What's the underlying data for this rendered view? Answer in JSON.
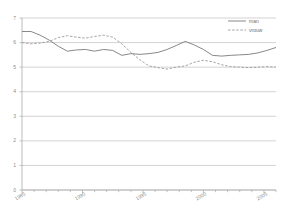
{
  "chart_data": {
    "type": "line",
    "title": "",
    "subtitle": "",
    "xlabel": "",
    "ylabel": "",
    "xlim": [
      1985,
      2006
    ],
    "ylim": [
      0,
      7
    ],
    "yticks": [
      0,
      1,
      2,
      3,
      4,
      5,
      6,
      7
    ],
    "ytick_labels": [
      "0",
      "1",
      "2",
      "3",
      "4",
      "5",
      "6",
      "7"
    ],
    "xticks": [
      1985,
      1990,
      1995,
      2000,
      2005
    ],
    "xtick_labels": [
      "1985",
      "1990",
      "1995",
      "2000",
      "2005"
    ],
    "grid": true,
    "grid_axis": "y",
    "legend_position": "top-right",
    "x": [
      1985,
      1986,
      1987,
      1988,
      1989,
      1990,
      1991,
      1992,
      1993,
      1994,
      1995,
      1996,
      1997,
      1998,
      1999,
      2000,
      2001,
      2002,
      2003,
      2004,
      2005,
      2006
    ],
    "series": [
      {
        "name": "man",
        "style": "solid",
        "color": "#7a7a7a",
        "values": [
          6.45,
          6.45,
          6.3,
          6.1,
          5.85,
          5.65,
          5.7,
          5.72,
          5.65,
          5.72,
          5.68,
          5.48,
          5.55,
          5.52,
          5.55,
          5.6,
          5.72,
          5.88,
          6.05,
          5.9,
          5.72,
          5.48
        ]
      },
      {
        "name": "vrouw",
        "style": "dashed",
        "color": "#9a9a9a",
        "values": [
          6.0,
          5.95,
          5.98,
          6.05,
          6.2,
          6.28,
          6.22,
          6.18,
          6.25,
          6.3,
          6.22,
          5.95,
          5.6,
          5.3,
          5.05,
          4.98,
          4.92,
          5.0,
          5.05,
          5.2,
          5.28,
          5.22
        ]
      }
    ],
    "series_tail": {
      "man": [
        5.48,
        5.45,
        5.48,
        5.5,
        5.52,
        5.58,
        5.68,
        5.8
      ],
      "vrouw": [
        5.22,
        5.1,
        5.02,
        5.0,
        4.98,
        5.0,
        5.02,
        5.0
      ]
    },
    "legend": [
      {
        "label": "man",
        "style": "solid"
      },
      {
        "label": "vrouw",
        "style": "dashed"
      }
    ],
    "axis_color": "#aaaaaa",
    "grid_color": "#b5b5b5",
    "background": "#ffffff"
  }
}
